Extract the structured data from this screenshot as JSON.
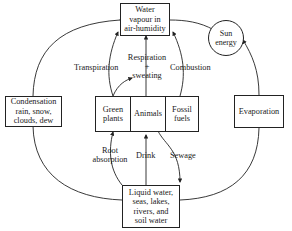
{
  "diagram": {
    "nodes": {
      "vapour": "Water vapour in air-humidity",
      "vapour_lines": [
        "Water",
        "vapour in",
        "air-humidity"
      ],
      "sun": [
        "Sun",
        "energy"
      ],
      "condensation": [
        "Condensation",
        "rain, snow,",
        "clouds, dew"
      ],
      "evaporation": "Evaporation",
      "green_plants": [
        "Green",
        "plants"
      ],
      "animals": "Animals",
      "fossil_fuels": [
        "Fossil",
        "fuels"
      ],
      "liquid": [
        "Liquid water,",
        "seas, lakes,",
        "rivers, and",
        "soil water"
      ]
    },
    "edges": {
      "transpiration": "Transpiration",
      "respiration": [
        "Respiration",
        "+",
        "sweating"
      ],
      "combustion": "Combustion",
      "root_absorption": [
        "Root",
        "absorption"
      ],
      "drink": "Drink",
      "sewage": "Sewage"
    }
  }
}
